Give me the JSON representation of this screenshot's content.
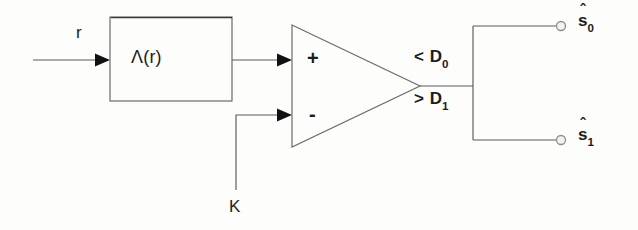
{
  "figure": {
    "background_color": "#fdfdfc",
    "line_color": "#5a5a5a",
    "text_color": "#1c1c1c",
    "arrow_color": "#111111"
  },
  "labels": {
    "input_signal": "r",
    "processing_block": "Λ(r)",
    "comparator_positive": "+",
    "comparator_negative": "-",
    "threshold_input": "K",
    "decision_upper_operator": "<",
    "decision_upper_symbol": "D",
    "decision_upper_subscript": "0",
    "decision_lower_operator": ">",
    "decision_lower_symbol": "D",
    "decision_lower_subscript": "1",
    "output_upper_symbol": "s",
    "output_upper_subscript": "0",
    "output_upper_hat": "ˆ",
    "output_lower_symbol": "s",
    "output_lower_subscript": "1",
    "output_lower_hat": "ˆ"
  },
  "nodes": [
    {
      "id": "likelihood-block",
      "kind": "rectangle",
      "label": "Λ(r)",
      "x": 110,
      "y": 17,
      "width": 122,
      "height": 84
    },
    {
      "id": "comparator",
      "kind": "triangle",
      "label": "comparator",
      "apex_x": 420,
      "apex_y": 86,
      "left_x": 292,
      "top_y": 25,
      "bottom_y": 147
    },
    {
      "id": "output-terminal-upper",
      "kind": "open-circle",
      "x": 561,
      "y": 26,
      "r": 4.5
    },
    {
      "id": "output-terminal-lower",
      "kind": "open-circle",
      "x": 561,
      "y": 140,
      "r": 4.5
    }
  ],
  "connections": [
    {
      "id": "input-to-block",
      "from": "input-r",
      "to": "likelihood-block",
      "arrow": true
    },
    {
      "id": "block-to-comparator-plus",
      "from": "likelihood-block",
      "to": "comparator-plus",
      "arrow": true
    },
    {
      "id": "threshold-to-comparator-minus",
      "from": "threshold-K",
      "to": "comparator-minus",
      "arrow": true
    },
    {
      "id": "comparator-to-bus",
      "from": "comparator",
      "to": "decision-bus",
      "arrow": false
    },
    {
      "id": "bus-to-output-upper",
      "from": "decision-bus",
      "to": "output-terminal-upper",
      "arrow": false
    },
    {
      "id": "bus-to-output-lower",
      "from": "decision-bus",
      "to": "output-terminal-lower",
      "arrow": false
    }
  ]
}
